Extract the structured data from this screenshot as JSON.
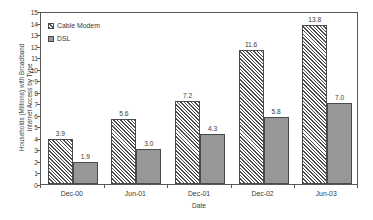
{
  "chart_data": {
    "type": "bar",
    "title": "",
    "xlabel": "Date",
    "ylabel": "Households (Millions) with Broadband\nInternet Access by Type",
    "categories": [
      "Dec-00",
      "Jun-01",
      "Dec-01",
      "Dec-02",
      "Jun-03"
    ],
    "series": [
      {
        "name": "Cable Modem",
        "values": [
          3.9,
          5.6,
          7.2,
          11.6,
          13.8
        ],
        "labels": [
          "3.9",
          "5.6",
          "7.2",
          "11.6",
          "13.8"
        ],
        "fill": "hatch-diagonal",
        "color": "#4d4d4d"
      },
      {
        "name": "DSL",
        "values": [
          1.9,
          3.0,
          4.3,
          5.8,
          7.0
        ],
        "labels": [
          "1.9",
          "3.0",
          "4.3",
          "5.8",
          "7.0"
        ],
        "fill": "solid",
        "color": "#979797"
      }
    ],
    "ylim": [
      0,
      15
    ],
    "ytick_step": 1,
    "yticks": [
      "15",
      "14",
      "13",
      "12",
      "11",
      "10",
      "9",
      "8",
      "7",
      "6",
      "5",
      "4",
      "3",
      "2",
      "1",
      "0"
    ],
    "grid": false,
    "legend_position": "top-left",
    "frame": true
  }
}
